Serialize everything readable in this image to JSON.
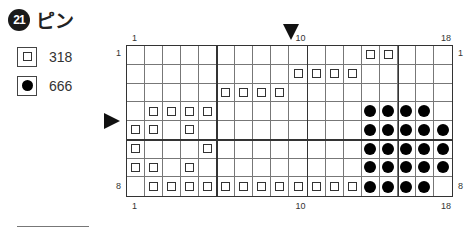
{
  "title": {
    "number": "21",
    "text": "ピン"
  },
  "legend": [
    {
      "symbol": "open-square",
      "label": "318"
    },
    {
      "symbol": "filled-circle",
      "label": "666"
    }
  ],
  "chart": {
    "columns": 18,
    "rows": 8,
    "top_labels": [
      {
        "col": 1,
        "text": "1"
      },
      {
        "col": 10,
        "text": "10"
      },
      {
        "col": 18,
        "text": "18"
      }
    ],
    "bottom_labels": [
      {
        "col": 1,
        "text": "1"
      },
      {
        "col": 10,
        "text": "10"
      },
      {
        "col": 18,
        "text": "18"
      }
    ],
    "left_labels": [
      {
        "row": 1,
        "text": "1"
      },
      {
        "row": 8,
        "text": "8"
      }
    ],
    "right_labels": [
      {
        "row": 1,
        "text": "1"
      },
      {
        "row": 8,
        "text": "8"
      }
    ],
    "center_column_marker": 10,
    "center_row_marker": 4.5,
    "thick_vertical_after_cols": [
      5,
      10,
      15
    ],
    "thick_horizontal_after_rows": [
      5
    ],
    "pattern": [
      ".............SS...",
      ".........SSSS.....",
      ".....SSSS.........",
      ".SSSS........CCCC.",
      "SS.S.........CCCCC",
      "S...S........CCCCC",
      "SS.S.........CCCCC",
      ".SSSSSSSSSSSSCCCC."
    ],
    "pattern_key": {
      "S": "318 (open square)",
      "C": "666 (filled circle)",
      ".": "empty"
    }
  }
}
